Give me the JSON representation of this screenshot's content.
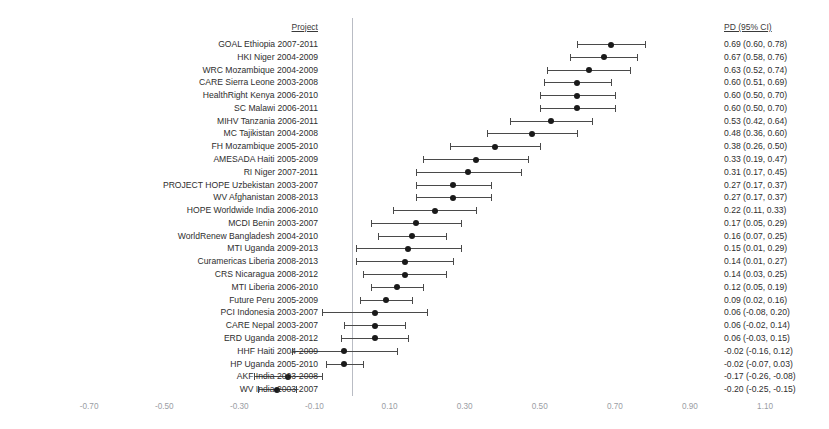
{
  "headers": {
    "project": "Project",
    "ci": "PD (95% CI)"
  },
  "colors": {
    "marker": "#1a1a1a",
    "whisker": "#4a4a4a",
    "zero_line": "#b9bcc4",
    "text": "#2e2e2e",
    "tick_text": "#9a9da4",
    "background": "#ffffff"
  },
  "chart_data": {
    "type": "scatter",
    "title": "",
    "subtitle": "",
    "xlabel": "",
    "ylabel": "",
    "grid": false,
    "legend": "none",
    "reference_line": 0.0,
    "xlim": [
      -0.8,
      1.2
    ],
    "xticks": [
      -0.7,
      -0.5,
      -0.3,
      -0.1,
      0.1,
      0.3,
      0.5,
      0.7,
      0.9,
      1.1
    ],
    "xtick_labels": [
      "-0.70",
      "-0.50",
      "-0.30",
      "-0.10",
      "0.10",
      "0.30",
      "0.50",
      "0.70",
      "0.90",
      "1.10"
    ],
    "columns": [
      "Project",
      "PD (95% CI)"
    ],
    "rows": [
      {
        "label": "GOAL Ethiopia 2007-2011",
        "ci_text": "0.69 (0.60, 0.78)",
        "estimate": 0.69,
        "low": 0.6,
        "high": 0.78
      },
      {
        "label": "HKI Niger 2004-2009",
        "ci_text": "0.67 (0.58, 0.76)",
        "estimate": 0.67,
        "low": 0.58,
        "high": 0.76
      },
      {
        "label": "WRC Mozambique 2004-2009",
        "ci_text": "0.63 (0.52, 0.74)",
        "estimate": 0.63,
        "low": 0.52,
        "high": 0.74
      },
      {
        "label": "CARE Sierra Leone 2003-2008",
        "ci_text": "0.60 (0.51, 0.69)",
        "estimate": 0.6,
        "low": 0.51,
        "high": 0.69
      },
      {
        "label": "HealthRight Kenya 2006-2010",
        "ci_text": "0.60 (0.50, 0.70)",
        "estimate": 0.6,
        "low": 0.5,
        "high": 0.7
      },
      {
        "label": "SC Malawi 2006-2011",
        "ci_text": "0.60 (0.50, 0.70)",
        "estimate": 0.6,
        "low": 0.5,
        "high": 0.7
      },
      {
        "label": "MIHV Tanzania 2006-2011",
        "ci_text": "0.53 (0.42, 0.64)",
        "estimate": 0.53,
        "low": 0.42,
        "high": 0.64
      },
      {
        "label": "MC Tajikistan 2004-2008",
        "ci_text": "0.48 (0.36, 0.60)",
        "estimate": 0.48,
        "low": 0.36,
        "high": 0.6
      },
      {
        "label": "FH Mozambique 2005-2010",
        "ci_text": "0.38 (0.26, 0.50)",
        "estimate": 0.38,
        "low": 0.26,
        "high": 0.5
      },
      {
        "label": "AMESADA Haiti 2005-2009",
        "ci_text": "0.33 (0.19, 0.47)",
        "estimate": 0.33,
        "low": 0.19,
        "high": 0.47
      },
      {
        "label": "RI Niger 2007-2011",
        "ci_text": "0.31 (0.17, 0.45)",
        "estimate": 0.31,
        "low": 0.17,
        "high": 0.45
      },
      {
        "label": "PROJECT HOPE Uzbekistan 2003-2007",
        "ci_text": "0.27 (0.17, 0.37)",
        "estimate": 0.27,
        "low": 0.17,
        "high": 0.37
      },
      {
        "label": "WV Afghanistan 2008-2013",
        "ci_text": "0.27 (0.17, 0.37)",
        "estimate": 0.27,
        "low": 0.17,
        "high": 0.37
      },
      {
        "label": "HOPE Worldwide India 2006-2010",
        "ci_text": "0.22 (0.11, 0.33)",
        "estimate": 0.22,
        "low": 0.11,
        "high": 0.33
      },
      {
        "label": "MCDI Benin 2003-2007",
        "ci_text": "0.17 (0.05, 0.29)",
        "estimate": 0.17,
        "low": 0.05,
        "high": 0.29
      },
      {
        "label": "WorldRenew Bangladesh 2004-2010",
        "ci_text": "0.16 (0.07, 0.25)",
        "estimate": 0.16,
        "low": 0.07,
        "high": 0.25
      },
      {
        "label": "MTI Uganda 2009-2013",
        "ci_text": "0.15 (0.01, 0.29)",
        "estimate": 0.15,
        "low": 0.01,
        "high": 0.29
      },
      {
        "label": "Curamericas Liberia 2008-2013",
        "ci_text": "0.14 (0.01, 0.27)",
        "estimate": 0.14,
        "low": 0.01,
        "high": 0.27
      },
      {
        "label": "CRS Nicaragua 2008-2012",
        "ci_text": "0.14 (0.03, 0.25)",
        "estimate": 0.14,
        "low": 0.03,
        "high": 0.25
      },
      {
        "label": "MTI Liberia 2006-2010",
        "ci_text": "0.12 (0.05, 0.19)",
        "estimate": 0.12,
        "low": 0.05,
        "high": 0.19
      },
      {
        "label": "Future Peru 2005-2009",
        "ci_text": "0.09 (0.02, 0.16)",
        "estimate": 0.09,
        "low": 0.02,
        "high": 0.16
      },
      {
        "label": "PCI Indonesia 2003-2007",
        "ci_text": "0.06 (-0.08, 0.20)",
        "estimate": 0.06,
        "low": -0.08,
        "high": 0.2
      },
      {
        "label": "CARE Nepal 2003-2007",
        "ci_text": "0.06 (-0.02, 0.14)",
        "estimate": 0.06,
        "low": -0.02,
        "high": 0.14
      },
      {
        "label": "ERD Uganda 2008-2012",
        "ci_text": "0.06 (-0.03, 0.15)",
        "estimate": 0.06,
        "low": -0.03,
        "high": 0.15
      },
      {
        "label": "HHF Haiti 2004-2009",
        "ci_text": "-0.02 (-0.16, 0.12)",
        "estimate": -0.02,
        "low": -0.16,
        "high": 0.12
      },
      {
        "label": "HP Uganda 2005-2010",
        "ci_text": "-0.02 (-0.07, 0.03)",
        "estimate": -0.02,
        "low": -0.07,
        "high": 0.03
      },
      {
        "label": "AKF India 2003-2008",
        "ci_text": "-0.17 (-0.26, -0.08)",
        "estimate": -0.17,
        "low": -0.26,
        "high": -0.08
      },
      {
        "label": "WV India 2003-2007",
        "ci_text": "-0.20 (-0.25, -0.15)",
        "estimate": -0.2,
        "low": -0.25,
        "high": -0.15
      }
    ]
  }
}
